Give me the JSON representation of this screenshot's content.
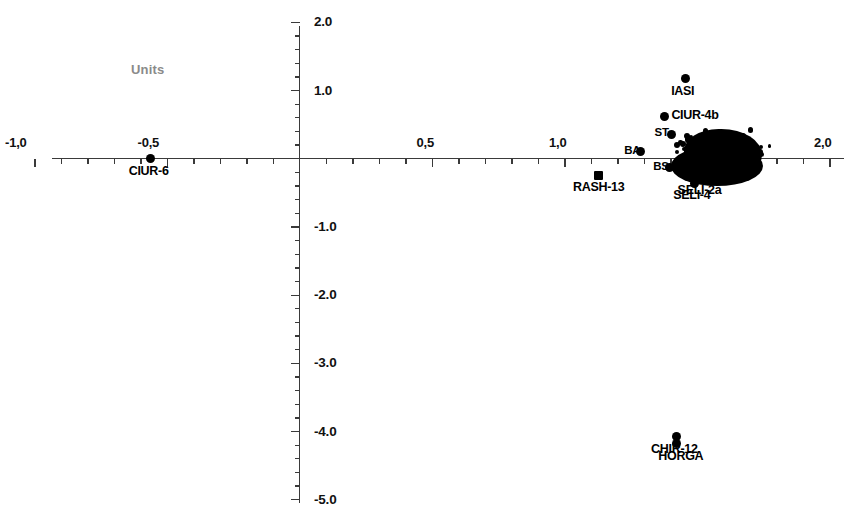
{
  "chart_data": {
    "type": "scatter",
    "title": "",
    "xlabel": "",
    "ylabel": "",
    "annotation": "Units",
    "xlim": [
      -1.0,
      2.0
    ],
    "ylim": [
      -5.0,
      2.0
    ],
    "grid": false,
    "legend": "none",
    "decimal_separator_x": ",",
    "decimal_separator_y": ".",
    "x_ticks": [
      {
        "value": -1.0,
        "label": "-1,0"
      },
      {
        "value": -0.5,
        "label": "-0,5"
      },
      {
        "value": 0.5,
        "label": "0,5"
      },
      {
        "value": 1.0,
        "label": "1,0"
      },
      {
        "value": 2.0,
        "label": "2,0"
      }
    ],
    "x_minor_step": 0.1,
    "y_ticks": [
      {
        "value": 2.0,
        "label": "2.0"
      },
      {
        "value": 1.0,
        "label": "1.0"
      },
      {
        "value": -1.0,
        "label": "-1.0"
      },
      {
        "value": -2.0,
        "label": "-2.0"
      },
      {
        "value": -3.0,
        "label": "-3.0"
      },
      {
        "value": -4.0,
        "label": "-4.0"
      },
      {
        "value": -5.0,
        "label": "-5.0"
      }
    ],
    "y_minor_step": 0.2,
    "labeled_points": [
      {
        "name": "CIUR-6",
        "x": -0.565,
        "y": 0.0,
        "marker": "circle",
        "label_pos": "below"
      },
      {
        "name": "RASH-13",
        "x": 1.125,
        "y": -0.24,
        "marker": "square",
        "label_pos": "below"
      },
      {
        "name": "IASI",
        "x": 1.455,
        "y": 1.17,
        "marker": "circle",
        "label_pos": "below"
      },
      {
        "name": "CIUR-4b",
        "x": 1.375,
        "y": 0.62,
        "marker": "circle",
        "label_pos": "right"
      },
      {
        "name": "BA",
        "x": 1.285,
        "y": 0.1,
        "marker": "circle",
        "label_pos": "left"
      },
      {
        "name": "ST",
        "x": 1.4,
        "y": 0.36,
        "marker": "circle",
        "label_pos": "left"
      },
      {
        "name": "BS",
        "x": 1.395,
        "y": -0.13,
        "marker": "circle",
        "label_pos": "left"
      },
      {
        "name": "SELI-2a",
        "x": 1.52,
        "y": -0.29,
        "marker": "circle",
        "label_pos": "below"
      },
      {
        "name": "SELI-4",
        "x": 1.49,
        "y": -0.36,
        "marker": "circle",
        "label_pos": "below"
      },
      {
        "name": "CHIR-12",
        "x": 1.42,
        "y": -4.08,
        "marker": "circle",
        "label_pos": "below"
      },
      {
        "name": "HORGA",
        "x": 1.42,
        "y": -4.18,
        "marker": "circle",
        "label_pos": "below"
      }
    ],
    "cluster": {
      "description": "dense unresolved cluster of overlapping points",
      "x_range": [
        1.28,
        1.9
      ],
      "y_range": [
        -0.4,
        0.78
      ],
      "center": [
        1.58,
        0.13
      ],
      "approx_count": 300
    }
  }
}
